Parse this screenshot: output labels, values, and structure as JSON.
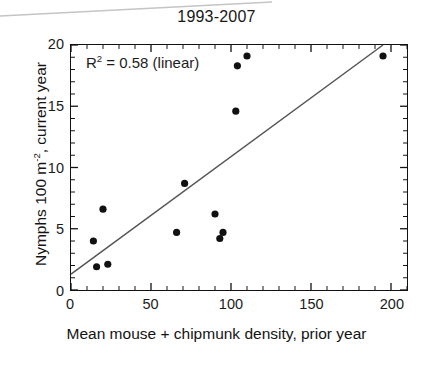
{
  "chart_data": {
    "type": "scatter",
    "title": "1993-2007",
    "xlabel": "Mean mouse + chipmunk density, prior year",
    "ylabel": "Nymphs 100 m⁻² , current year",
    "ylabel_main": "Nymphs 100 m",
    "ylabel_sup": "-2",
    "ylabel_tail": ", current year",
    "annotation": "R² = 0.58 (linear)",
    "annotation_prefix": "R",
    "annotation_sup": "2",
    "annotation_rest": " = 0.58 (linear)",
    "r_squared": 0.58,
    "fit": "linear",
    "xlim": [
      0,
      210
    ],
    "ylim": [
      0,
      20
    ],
    "xticks": [
      0,
      50,
      100,
      150,
      200
    ],
    "yticks": [
      0,
      5,
      10,
      15,
      20
    ],
    "xtick_labels": [
      "0",
      "50",
      "100",
      "150",
      "200"
    ],
    "ytick_labels": [
      "0",
      "5",
      "10",
      "15",
      "20"
    ],
    "grid": false,
    "legend": null,
    "marker": {
      "shape": "circle",
      "color": "#111111",
      "size": 6
    },
    "points": [
      {
        "x": 14,
        "y": 4.0
      },
      {
        "x": 16,
        "y": 1.9
      },
      {
        "x": 20,
        "y": 6.6
      },
      {
        "x": 23,
        "y": 2.1
      },
      {
        "x": 66,
        "y": 4.7
      },
      {
        "x": 71,
        "y": 8.7
      },
      {
        "x": 90,
        "y": 6.2
      },
      {
        "x": 93,
        "y": 4.2
      },
      {
        "x": 95,
        "y": 4.7
      },
      {
        "x": 103,
        "y": 14.6
      },
      {
        "x": 104,
        "y": 18.3
      },
      {
        "x": 110,
        "y": 19.1
      },
      {
        "x": 195,
        "y": 19.1
      }
    ],
    "trendline": {
      "type": "linear",
      "color": "#555555",
      "x_start": 0,
      "y_start": 1.3,
      "x_end": 195,
      "y_end": 20.0
    },
    "colors": {
      "axis": "#111111",
      "marker": "#111111",
      "trendline": "#555555",
      "text": "#1a1a1a",
      "background": "#ffffff",
      "artifact": "#c9c9c9"
    }
  }
}
